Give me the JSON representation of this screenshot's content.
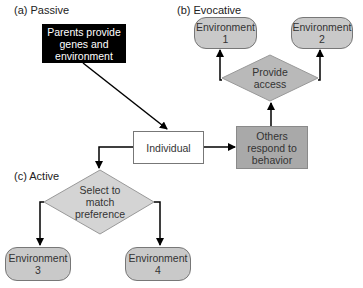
{
  "labels": {
    "passive": "(a) Passive",
    "evocative": "(b) Evocative",
    "active": "(c) Active"
  },
  "nodes": {
    "parents": {
      "line1": "Parents provide",
      "line2": "genes and",
      "line3": "environment"
    },
    "individual": {
      "text": "Individual"
    },
    "others": {
      "line1": "Others",
      "line2": "respond to",
      "line3": "behavior"
    },
    "provide": {
      "line1": "Provide",
      "line2": "access"
    },
    "select": {
      "line1": "Select to",
      "line2": "match",
      "line3": "preference"
    },
    "env1": {
      "line1": "Environment",
      "line2": "1"
    },
    "env2": {
      "line1": "Environment",
      "line2": "2"
    },
    "env3": {
      "line1": "Environment",
      "line2": "3"
    },
    "env4": {
      "line1": "Environment",
      "line2": "4"
    }
  },
  "colors": {
    "black_box": "#000000",
    "gray_box": "#a9a9a9",
    "diamond": "#b9b9b9",
    "select_diamond": "#d4d4d4",
    "pill": "#c9c9c9"
  }
}
